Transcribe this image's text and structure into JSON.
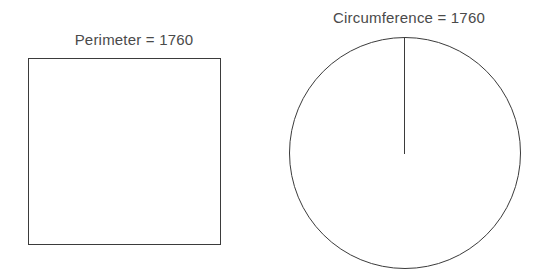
{
  "figure": {
    "background_color": "#ffffff",
    "stroke_color": "#3b3b3b",
    "text_color": "#4a4a4a",
    "width": 549,
    "height": 279
  },
  "square_panel": {
    "label": "Perimeter = 1760",
    "measure_name": "Perimeter",
    "measure_value": "1760",
    "shape": "square",
    "geometry": {
      "x": 28,
      "y": 58,
      "width": 193,
      "height": 187
    }
  },
  "circle_panel": {
    "label": "Circumference = 1760",
    "measure_name": "Circumference",
    "measure_value": "1760",
    "shape": "circle",
    "geometry": {
      "cx": 405,
      "cy": 153,
      "r": 116
    },
    "radius_line": {
      "x1": 404,
      "y1": 37,
      "x2": 404,
      "y2": 154
    }
  },
  "chart_data": {
    "type": "diagram",
    "title": "",
    "shapes": [
      {
        "name": "square",
        "label": "Perimeter = 1760",
        "measure": "Perimeter",
        "value": 1760,
        "side_length": 440
      },
      {
        "name": "circle",
        "label": "Circumference = 1760",
        "measure": "Circumference",
        "value": 1760,
        "annotations": [
          "radius"
        ]
      }
    ]
  }
}
